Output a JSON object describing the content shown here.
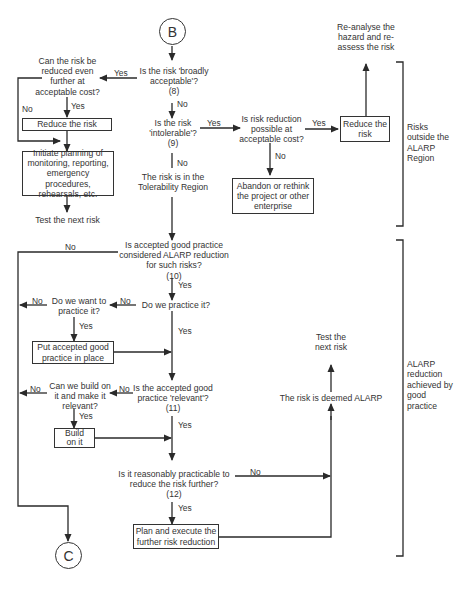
{
  "connectors": {
    "start": "B",
    "end": "C"
  },
  "nodes": {
    "q8": {
      "text": "Is the risk 'broadly acceptable'?",
      "num": "(8)"
    },
    "q9": {
      "text": "Is the risk 'intolerable'?",
      "num": "(9)"
    },
    "q_reduce_further": {
      "text": "Can the risk be reduced even further at acceptable cost?"
    },
    "reduce_risk_left": {
      "text": "Reduce the risk"
    },
    "initiate_planning": {
      "text": "Initiate planning of monitoring, reporting, emergency procedures, rehearsals, etc."
    },
    "test_next_risk_left": {
      "text": "Test the next risk"
    },
    "q_reduction_possible": {
      "text": "Is risk reduction possible at acceptable cost?"
    },
    "reduce_risk_right": {
      "text": "Reduce the risk"
    },
    "reanalyse": {
      "text": "Re-analyse the hazard and re-assess the risk"
    },
    "abandon": {
      "text": "Abandon or rethink the project or other enterprise"
    },
    "tolerability": {
      "text": "The risk is in the Tolerability Region"
    },
    "q10": {
      "text": "Is accepted good practice considered ALARP reduction for such risks?",
      "num": "(10)"
    },
    "q_practice": {
      "text": "Do we practice it?"
    },
    "q_want_practice": {
      "text": "Do we want to practice it?"
    },
    "put_practice": {
      "text": "Put accepted good practice in place"
    },
    "q11": {
      "text": "Is the accepted good practice 'relevant'?",
      "num": "(11)"
    },
    "q_build_on": {
      "text": "Can we build on it and make it relevant?"
    },
    "build_on": {
      "text": "Build on it"
    },
    "q12": {
      "text": "Is it reasonably practicable to reduce the risk further?",
      "num": "(12)"
    },
    "plan_execute": {
      "text": "Plan and execute the further risk reduction"
    },
    "deemed_alarp": {
      "text": "The risk is deemed ALARP"
    },
    "test_next_risk_right": {
      "text": "Test the next risk"
    }
  },
  "edge_labels": {
    "yes": "Yes",
    "no": "No"
  },
  "regions": [
    {
      "label": "Risks outside the ALARP Region"
    },
    {
      "label": "ALARP reduction achieved by good practice"
    }
  ],
  "colors": {
    "line": "#2a2a2a",
    "text": "#333333",
    "background": "#ffffff"
  }
}
